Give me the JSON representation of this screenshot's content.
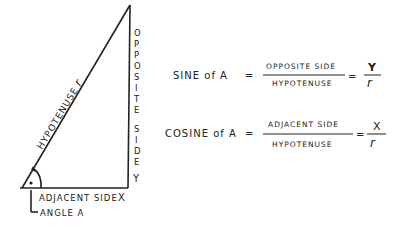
{
  "diagram": {
    "hypotenuse_label": "HYPOTENUSE",
    "hypotenuse_var": "r",
    "opposite_letters": [
      "O",
      "P",
      "P",
      "O",
      "S",
      "I",
      "T",
      "E"
    ],
    "side_letters": [
      "S",
      "I",
      "D",
      "E"
    ],
    "opposite_var": "Y",
    "adjacent_label": "ADJACENT SIDE",
    "adjacent_var": "X",
    "angle_label": "ANGLE A"
  },
  "formulas": {
    "sine": {
      "lhs": "SINE of A",
      "eq": "=",
      "numerator": "OPPOSITE SIDE",
      "denominator": "HYPOTENUSE",
      "eq2": "=",
      "var_num": "Y",
      "var_den": "r"
    },
    "cosine": {
      "lhs": "COSINE of A",
      "eq": "=",
      "numerator": "ADJACENT SIDE",
      "denominator": "HYPOTENUSE",
      "eq2": "=",
      "var_num": "X",
      "var_den": "r"
    }
  }
}
